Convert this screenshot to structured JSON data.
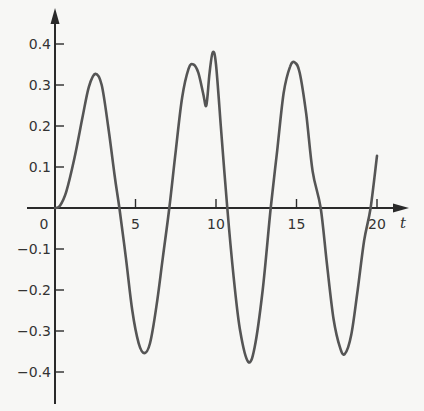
{
  "chart_data": {
    "type": "line",
    "title": "",
    "xlabel": "t",
    "ylabel": "",
    "xlim": [
      0,
      20.5
    ],
    "ylim": [
      -0.45,
      0.45
    ],
    "grid": false,
    "legend": null,
    "x_ticks": [
      {
        "value": 0,
        "label": "0"
      },
      {
        "value": 5,
        "label": "5"
      },
      {
        "value": 10,
        "label": "10"
      },
      {
        "value": 15,
        "label": "15"
      },
      {
        "value": 20,
        "label": "20"
      }
    ],
    "y_ticks": [
      {
        "value": 0.4,
        "label": "0.4"
      },
      {
        "value": 0.3,
        "label": "0.3"
      },
      {
        "value": 0.2,
        "label": "0.2"
      },
      {
        "value": 0.1,
        "label": "0.1"
      },
      {
        "value": -0.1,
        "label": "-0.1"
      },
      {
        "value": -0.2,
        "label": "-0.2"
      },
      {
        "value": -0.3,
        "label": "-0.3"
      },
      {
        "value": -0.4,
        "label": "-0.4"
      }
    ],
    "series": [
      {
        "name": "response",
        "x": [
          0,
          0.3,
          0.7,
          1.2,
          1.7,
          2.1,
          2.5,
          2.9,
          3.3,
          3.7,
          4.0,
          4.4,
          4.8,
          5.2,
          5.55,
          5.9,
          6.3,
          6.7,
          7.1,
          7.5,
          7.9,
          8.3,
          8.6,
          8.9,
          9.2,
          9.4,
          9.6,
          9.8,
          10.0,
          10.3,
          10.7,
          11.1,
          11.5,
          12.0,
          12.4,
          12.9,
          13.4,
          13.8,
          14.2,
          14.6,
          14.9,
          15.2,
          15.6,
          16.0,
          16.5,
          16.9,
          17.3,
          17.7,
          18.0,
          18.4,
          18.8,
          19.2,
          19.6,
          20.0
        ],
        "y": [
          0,
          0.005,
          0.04,
          0.12,
          0.22,
          0.295,
          0.327,
          0.3,
          0.2,
          0.08,
          0,
          -0.12,
          -0.25,
          -0.33,
          -0.354,
          -0.33,
          -0.24,
          -0.12,
          0,
          0.14,
          0.27,
          0.34,
          0.35,
          0.33,
          0.28,
          0.25,
          0.33,
          0.38,
          0.35,
          0.2,
          0,
          -0.17,
          -0.3,
          -0.375,
          -0.34,
          -0.2,
          0,
          0.14,
          0.28,
          0.345,
          0.355,
          0.33,
          0.23,
          0.09,
          0,
          -0.14,
          -0.27,
          -0.34,
          -0.356,
          -0.31,
          -0.2,
          -0.08,
          0,
          0.127
        ]
      }
    ]
  },
  "axes": {
    "x_label": "t",
    "origin_label": "0"
  }
}
